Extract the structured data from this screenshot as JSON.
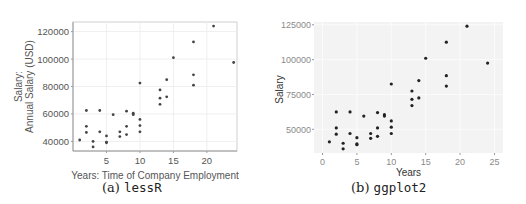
{
  "chart_data": [
    {
      "type": "scatter",
      "library": "lessR",
      "caption_label": "(a)",
      "caption_name": "lessR",
      "title": "",
      "xlabel": "Years: Time of Company Employment",
      "ylabel_line1": "Salary:",
      "ylabel_line2": "Annual Salary (USD)",
      "xticks": [
        5,
        10,
        15,
        20
      ],
      "yticks": [
        40000,
        60000,
        80000,
        100000,
        120000
      ],
      "xlim": [
        0,
        24.5
      ],
      "ylim": [
        33000,
        127000
      ],
      "grid": true,
      "point_color": "#444444",
      "background": "#ffffff",
      "frame_color": "#cfcfcf",
      "grid_color": "#efefef",
      "x": [
        1,
        2,
        2,
        2,
        3,
        3,
        4,
        4,
        5,
        5,
        5,
        6,
        7,
        7,
        8,
        8,
        8,
        9,
        9,
        10,
        10,
        10,
        10,
        13,
        13,
        13,
        14,
        14,
        15,
        18,
        18,
        18,
        21,
        24
      ],
      "y": [
        41000,
        62500,
        51000,
        46500,
        40000,
        36000,
        62500,
        47000,
        44000,
        39500,
        39000,
        59500,
        47000,
        43500,
        62000,
        51000,
        45000,
        60500,
        59500,
        82500,
        56000,
        51500,
        47000,
        77500,
        71500,
        67000,
        85000,
        72500,
        101000,
        112500,
        88500,
        81000,
        124000,
        97500
      ]
    },
    {
      "type": "scatter",
      "library": "ggplot2",
      "caption_label": "(b)",
      "caption_name": "ggplot2",
      "title": "",
      "xlabel": "Years",
      "ylabel": "Salary",
      "xticks": [
        0,
        5,
        10,
        15,
        20,
        25
      ],
      "yticks": [
        50000,
        75000,
        100000,
        125000
      ],
      "xlim": [
        0,
        25
      ],
      "ylim": [
        33000,
        127000
      ],
      "grid": true,
      "point_color": "#222222",
      "background": "#ffffff",
      "panel_color": "#f3f3f3",
      "grid_color": "#fbfbfb",
      "x": [
        1,
        2,
        2,
        2,
        3,
        3,
        4,
        4,
        5,
        5,
        5,
        6,
        7,
        7,
        8,
        8,
        8,
        9,
        9,
        10,
        10,
        10,
        10,
        13,
        13,
        13,
        14,
        14,
        15,
        18,
        18,
        18,
        21,
        24
      ],
      "y": [
        41000,
        62500,
        51000,
        46500,
        40000,
        36000,
        62500,
        47000,
        44000,
        39500,
        39000,
        59500,
        47000,
        43500,
        62000,
        51000,
        45000,
        60500,
        59500,
        82500,
        56000,
        51500,
        47000,
        77500,
        71500,
        67000,
        85000,
        72500,
        101000,
        112500,
        88500,
        81000,
        124000,
        97500
      ]
    }
  ]
}
